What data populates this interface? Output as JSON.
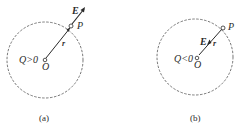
{
  "diagram": {
    "panels": [
      {
        "id": "a",
        "caption": "(a)",
        "charge_label": "Q>0",
        "origin_label": "O",
        "point_label": "P",
        "radius_label": "r",
        "field_label": "E",
        "field_direction": "outward"
      },
      {
        "id": "b",
        "caption": "(b)",
        "charge_label": "Q<0",
        "origin_label": "O",
        "point_label": "P",
        "radius_label": "r",
        "field_label": "E",
        "field_direction": "inward"
      }
    ],
    "colors": {
      "stroke": "#2a2a2a",
      "dashed_circle": "#555555",
      "background": "#ffffff"
    }
  }
}
